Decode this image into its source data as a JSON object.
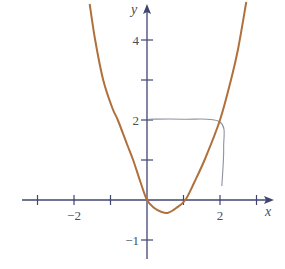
{
  "chart_data": {
    "type": "line",
    "title": "",
    "xlabel": "x",
    "ylabel": "y",
    "xlim": [
      -3.4,
      3.5
    ],
    "ylim": [
      -1.5,
      5
    ],
    "grid": false,
    "legend": "none",
    "x_ticks": [
      -3,
      -2,
      -1,
      1,
      2,
      3
    ],
    "x_tick_labels": [
      {
        "value": -2,
        "label": "−2"
      },
      {
        "value": 2,
        "label": "2"
      }
    ],
    "y_ticks": [
      -1,
      1,
      2,
      3,
      4
    ],
    "y_tick_labels": [
      {
        "value": 4,
        "label": "4"
      },
      {
        "value": 2,
        "label": "2"
      },
      {
        "value": -1,
        "label": "−1"
      }
    ],
    "series": [
      {
        "name": "curve",
        "color": "#b0703c",
        "points": [
          [
            -1.57,
            4.9
          ],
          [
            -1.42,
            4.0
          ],
          [
            -1.2,
            3.0
          ],
          [
            -0.95,
            2.3
          ],
          [
            -0.8,
            2.0
          ],
          [
            -0.55,
            1.4
          ],
          [
            -0.38,
            1.0
          ],
          [
            -0.18,
            0.45
          ],
          [
            0.0,
            0.0
          ],
          [
            0.2,
            -0.2
          ],
          [
            0.4,
            -0.3
          ],
          [
            0.58,
            -0.32
          ],
          [
            0.8,
            -0.2
          ],
          [
            1.05,
            0.0
          ],
          [
            1.3,
            0.45
          ],
          [
            1.6,
            1.05
          ],
          [
            2.0,
            2.0
          ],
          [
            2.3,
            3.0
          ],
          [
            2.5,
            3.8
          ],
          [
            2.72,
            4.95
          ]
        ]
      }
    ],
    "annotations": [
      {
        "type": "hand-drawn guide",
        "color": "#8d929c",
        "description": "line from (0,2) to point (2,2) on curve, then down to (2,0)",
        "points": [
          [
            0.05,
            2.02
          ],
          [
            1.0,
            2.02
          ],
          [
            2.0,
            1.95
          ],
          [
            2.1,
            1.3
          ],
          [
            2.05,
            0.35
          ]
        ]
      }
    ]
  }
}
